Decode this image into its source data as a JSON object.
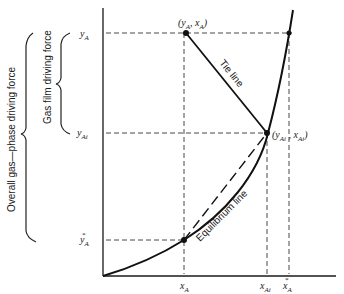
{
  "diagram": {
    "title": "",
    "axes": {
      "y_tick_labels": [
        {
          "main": "y",
          "sub": "A",
          "sup": ""
        },
        {
          "main": "y",
          "sub": "Ai",
          "sup": ""
        },
        {
          "main": "y",
          "sub": "A",
          "sup": "*"
        }
      ],
      "x_tick_labels": [
        {
          "main": "x",
          "sub": "A",
          "sup": ""
        },
        {
          "main": "x",
          "sub": "Ai",
          "sup": ""
        },
        {
          "main": "x",
          "sub": "A",
          "sup": "*"
        }
      ]
    },
    "points": {
      "bulk": {
        "label": "(y",
        "sub1": "A",
        "mid": ", x",
        "sub2": "A",
        "end": ")"
      },
      "interface": {
        "label": "(y",
        "sub1": "Ai",
        "mid": " , x",
        "sub2": "Ai",
        "end": ")"
      }
    },
    "lines": {
      "tie_line": "Tie line",
      "equilibrium_line": "Equilibrium line"
    },
    "braces": {
      "gas_film": "Gas film driving force",
      "overall": "Overall gas—phase driving force"
    },
    "colors": {
      "ink": "#111111",
      "background": "#ffffff"
    }
  }
}
